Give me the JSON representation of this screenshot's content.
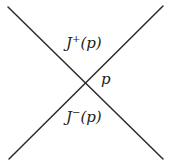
{
  "diagram": {
    "lines": [
      {
        "name": "light-ray-descending",
        "x1": 8,
        "y1": 7,
        "x2": 163,
        "y2": 159
      },
      {
        "name": "light-ray-ascending",
        "x1": 9,
        "y1": 159,
        "x2": 163,
        "y2": 6
      }
    ],
    "stroke_color": "#2b2b2b",
    "labels": {
      "future": {
        "symbol": "J",
        "superscript": "+",
        "argument": "(p)"
      },
      "past": {
        "symbol": "J",
        "superscript": "−",
        "argument": "(p)"
      },
      "point": "p"
    }
  }
}
